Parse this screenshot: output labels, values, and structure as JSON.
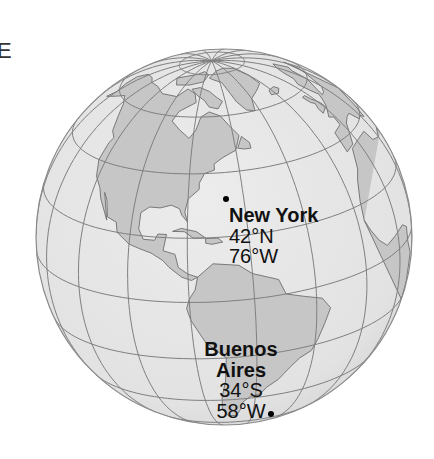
{
  "map": {
    "type": "orthographic-globe",
    "style": "grayscale",
    "colors": {
      "ocean": "#e6e6e6",
      "land": "#c6c6c6",
      "graticule": "#7f7f7f",
      "coastline": "#6e6e6e",
      "text": "#111111"
    },
    "corner_letter": "E",
    "cities": [
      {
        "name": "New York",
        "lat_label": "42°N",
        "lon_label": "76°W"
      },
      {
        "name_line1": "Buenos",
        "name_line2": "Aires",
        "lat_label": "34°S",
        "lon_label": "58°W"
      }
    ]
  }
}
